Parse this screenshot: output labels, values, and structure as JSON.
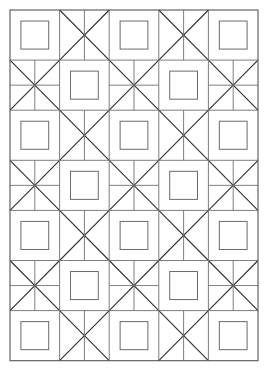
{
  "document": {
    "title": "Geometric Tile Pattern",
    "kind": "line-art-tiling",
    "background_color": "#ffffff"
  },
  "canvas": {
    "width": 269,
    "height": 374
  },
  "pattern": {
    "name": "checkerboard-square-and-star-tiling",
    "columns": 5,
    "rows": 7,
    "origin_x": 10,
    "origin_y": 10,
    "cell_width": 49.6,
    "cell_height": 50.1,
    "square_inset_ratio": 0.22,
    "parity_rule": "even-parity cells render an inset square; odd-parity cells render a star motif",
    "star_variant_rule": "cells in even-indexed rows render a 6-line star (two diagonals plus a vertical); cells in odd-indexed rows render an 8-line star (two diagonals plus vertical and horizontal)",
    "colors": {
      "outer_frame": "#555555",
      "grid_line": "#6e6e6e",
      "inner_square": "#6a6a6a",
      "diagonal": "#2e2e2e",
      "spoke": "#707070"
    },
    "stroke_widths": {
      "outer_frame": 1.1,
      "grid_line": 0.9,
      "inner_square": 1.0,
      "diagonal": 1.1,
      "spoke": 0.9
    },
    "cell_types": {
      "square": "inset-square",
      "star6": "x-with-vertical",
      "star8": "x-with-vertical-and-horizontal"
    },
    "layout": [
      [
        "square",
        "star6",
        "square",
        "star6",
        "square"
      ],
      [
        "star8",
        "square",
        "star8",
        "square",
        "star8"
      ],
      [
        "square",
        "star6",
        "square",
        "star6",
        "square"
      ],
      [
        "star8",
        "square",
        "star8",
        "square",
        "star8"
      ],
      [
        "square",
        "star6",
        "square",
        "star6",
        "square"
      ],
      [
        "star8",
        "square",
        "star8",
        "square",
        "star8"
      ],
      [
        "square",
        "star6",
        "square",
        "star6",
        "square"
      ]
    ]
  }
}
